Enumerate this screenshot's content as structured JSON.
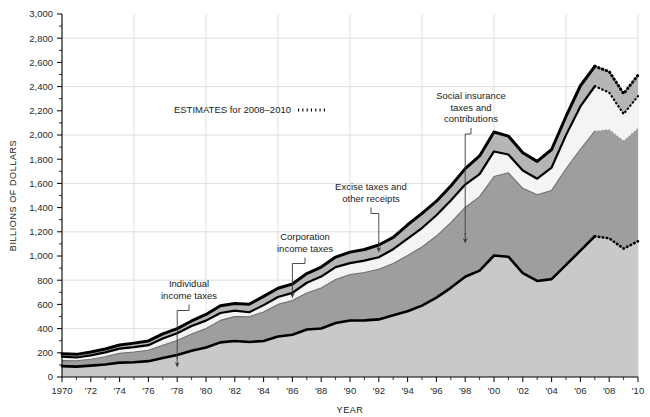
{
  "chart_data": {
    "type": "area",
    "stacked": true,
    "title": "",
    "xlabel": "YEAR",
    "ylabel": "BILLIONS OF DOLLARS",
    "xlim": [
      1970,
      2010
    ],
    "ylim": [
      0,
      3000
    ],
    "y_tick_step": 200,
    "x_tick_step": 2,
    "grid": "both",
    "grid_x_years": [
      1975,
      1980,
      1985,
      1990,
      1995,
      2000,
      2005,
      2010
    ],
    "grid_y_values": [
      400,
      800,
      1200,
      1600,
      2000,
      2400,
      2800
    ],
    "legend_position": "inside-top-left",
    "x": [
      1970,
      1971,
      1972,
      1973,
      1974,
      1975,
      1976,
      1977,
      1978,
      1979,
      1980,
      1981,
      1982,
      1983,
      1984,
      1985,
      1986,
      1987,
      1988,
      1989,
      1990,
      1991,
      1992,
      1993,
      1994,
      1995,
      1996,
      1997,
      1998,
      1999,
      2000,
      2001,
      2002,
      2003,
      2004,
      2005,
      2006,
      2007,
      2008,
      2009,
      2010
    ],
    "x_tick_labels": [
      "1970",
      "'72",
      "'74",
      "'76",
      "'78",
      "'80",
      "'82",
      "'84",
      "'86",
      "'88",
      "'90",
      "'92",
      "'94",
      "'96",
      "'98",
      "'00",
      "'02",
      "'04",
      "'06",
      "'08",
      "'10"
    ],
    "y_tick_labels": [
      "0",
      "200",
      "400",
      "600",
      "800",
      "1,000",
      "1,200",
      "1,400",
      "1,600",
      "1,800",
      "2,000",
      "2,200",
      "2,400",
      "2,600",
      "2,800",
      "3,000"
    ],
    "estimate_start_year": 2007,
    "series": [
      {
        "name": "Individual income taxes",
        "color": "#c9c9c9",
        "values": [
          90,
          86,
          94,
          103,
          119,
          122,
          131,
          157,
          181,
          217,
          244,
          286,
          298,
          289,
          298,
          335,
          349,
          392,
          401,
          446,
          467,
          468,
          476,
          510,
          543,
          590,
          656,
          737,
          829,
          879,
          1004,
          994,
          858,
          794,
          809,
          927,
          1044,
          1163,
          1146,
          1061,
          1122
        ]
      },
      {
        "name": "Social insurance taxes and contributions",
        "color": "#9e9e9e",
        "values": [
          45,
          48,
          53,
          64,
          76,
          84,
          90,
          106,
          121,
          138,
          157,
          182,
          201,
          209,
          239,
          265,
          283,
          303,
          334,
          359,
          380,
          396,
          414,
          428,
          461,
          484,
          509,
          539,
          572,
          612,
          653,
          694,
          701,
          713,
          733,
          794,
          838,
          870,
          900,
          891,
          934
        ]
      },
      {
        "name": "Corporation income taxes",
        "color": "#f4f4f4",
        "values": [
          33,
          27,
          32,
          36,
          39,
          41,
          42,
          55,
          60,
          66,
          65,
          61,
          49,
          37,
          57,
          61,
          63,
          84,
          95,
          103,
          94,
          98,
          100,
          118,
          140,
          157,
          172,
          182,
          189,
          185,
          207,
          151,
          148,
          132,
          189,
          278,
          354,
          370,
          304,
          222,
          265
        ]
      },
      {
        "name": "Excise taxes and other receipts",
        "color": "#b5b5b5",
        "values": [
          25,
          26,
          28,
          28,
          30,
          33,
          35,
          38,
          38,
          42,
          51,
          60,
          60,
          66,
          72,
          73,
          74,
          76,
          79,
          83,
          91,
          92,
          101,
          98,
          114,
          121,
          116,
          121,
          132,
          151,
          161,
          152,
          146,
          143,
          149,
          154,
          171,
          165,
          174,
          168,
          173
        ]
      }
    ],
    "annotations": [
      {
        "label": "Individual income taxes",
        "lines": [
          "Individual",
          "income taxes"
        ],
        "target_year": 1978,
        "series": "Individual income taxes"
      },
      {
        "label": "Corporation income taxes",
        "lines": [
          "Corporation",
          "income taxes"
        ],
        "target_year": 1986,
        "series": "Corporation income taxes"
      },
      {
        "label": "Excise taxes and other receipts",
        "lines": [
          "Excise taxes and",
          "other receipts"
        ],
        "target_year": 1992,
        "series": "Excise taxes and other receipts"
      },
      {
        "label": "Social insurance taxes and contributions",
        "lines": [
          "Social insurance",
          "taxes and",
          "contributions"
        ],
        "target_year": 1998,
        "series": "Social insurance taxes and contributions"
      }
    ],
    "legend": {
      "text": "ESTIMATES for 2008–2010",
      "marker": "dotted-line"
    },
    "colors": {
      "outline": "#000000",
      "grid": "#d7d7d7",
      "axis": "#000000",
      "background": "#ffffff"
    }
  }
}
